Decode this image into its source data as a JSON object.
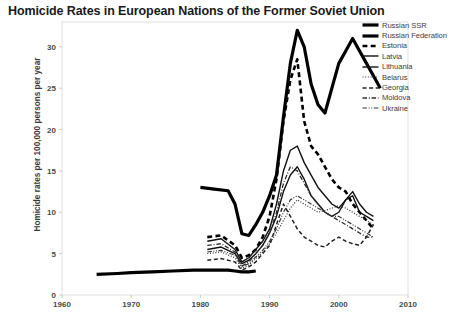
{
  "chart_data": {
    "type": "line",
    "title": "Homicide Rates in European Nations of the Former Soviet Union",
    "xlabel": "",
    "ylabel": "Homicide rates per 100,000 persons per year",
    "xlim": [
      1960,
      2010
    ],
    "ylim": [
      0,
      33
    ],
    "xticks": [
      1960,
      1970,
      1980,
      1990,
      2000,
      2010
    ],
    "yticks": [
      0,
      5,
      10,
      15,
      20,
      25,
      30
    ],
    "grid": false,
    "legend_position": "top-right",
    "series": [
      {
        "name": "Russian SSR",
        "style": "solid",
        "width": 3.2,
        "color": "#000000",
        "x": [
          1965,
          1968,
          1970,
          1973,
          1976,
          1979,
          1980,
          1982,
          1984,
          1985,
          1986,
          1987,
          1988
        ],
        "y": [
          2.5,
          2.6,
          2.7,
          2.8,
          2.9,
          3.0,
          3.0,
          3.0,
          3.0,
          2.9,
          2.8,
          2.8,
          2.9
        ]
      },
      {
        "name": "Russian Federation",
        "style": "solid",
        "width": 3.2,
        "color": "#000000",
        "x": [
          1980,
          1982,
          1984,
          1985,
          1986,
          1987,
          1988,
          1989,
          1990,
          1991,
          1992,
          1993,
          1994,
          1995,
          1996,
          1997,
          1998,
          1999,
          2000,
          2001,
          2002,
          2003,
          2004,
          2005,
          2006
        ],
        "y": [
          13.0,
          12.8,
          12.6,
          11.0,
          7.4,
          7.2,
          8.5,
          10.0,
          12.0,
          14.5,
          21.5,
          28.0,
          32.0,
          30.0,
          25.5,
          23.0,
          22.0,
          25.0,
          28.0,
          29.5,
          31.0,
          29.5,
          28.0,
          26.5,
          25.0
        ]
      },
      {
        "name": "Estonia",
        "style": "bold-dashed",
        "width": 2.6,
        "color": "#000000",
        "x": [
          1981,
          1983,
          1985,
          1986,
          1987,
          1988,
          1989,
          1990,
          1991,
          1992,
          1993,
          1994,
          1995,
          1996,
          1997,
          1998,
          1999,
          2000,
          2001,
          2002,
          2003,
          2004,
          2005
        ],
        "y": [
          7.0,
          7.2,
          6.0,
          4.5,
          4.8,
          5.5,
          7.0,
          9.5,
          14.0,
          21.0,
          26.0,
          28.5,
          21.0,
          18.0,
          17.0,
          15.5,
          14.0,
          13.0,
          12.5,
          11.0,
          10.0,
          9.0,
          8.0
        ]
      },
      {
        "name": "Latvia",
        "style": "solid",
        "width": 1.4,
        "color": "#111111",
        "x": [
          1981,
          1983,
          1985,
          1986,
          1987,
          1988,
          1989,
          1990,
          1991,
          1992,
          1993,
          1994,
          1995,
          1996,
          1997,
          1998,
          1999,
          2000,
          2001,
          2002,
          2003,
          2004,
          2005
        ],
        "y": [
          6.5,
          6.8,
          5.5,
          4.0,
          4.5,
          5.5,
          6.5,
          8.0,
          11.0,
          15.0,
          17.5,
          18.0,
          16.0,
          14.5,
          13.0,
          12.0,
          11.0,
          10.5,
          11.5,
          12.0,
          10.0,
          9.5,
          9.0
        ]
      },
      {
        "name": "Lithuania",
        "style": "solid",
        "width": 1.4,
        "color": "#111111",
        "x": [
          1981,
          1983,
          1985,
          1986,
          1987,
          1988,
          1989,
          1990,
          1991,
          1992,
          1993,
          1994,
          1995,
          1996,
          1997,
          1998,
          1999,
          2000,
          2001,
          2002,
          2003,
          2004,
          2005
        ],
        "y": [
          5.5,
          5.8,
          5.0,
          3.8,
          4.2,
          5.0,
          6.0,
          7.5,
          9.5,
          12.5,
          14.5,
          15.5,
          14.0,
          12.0,
          11.0,
          10.0,
          9.5,
          10.0,
          11.5,
          12.5,
          11.0,
          10.0,
          9.5
        ]
      },
      {
        "name": "Belarus",
        "style": "dotted",
        "width": 1.2,
        "color": "#333333",
        "x": [
          1981,
          1983,
          1985,
          1986,
          1987,
          1988,
          1989,
          1990,
          1991,
          1992,
          1993,
          1994,
          1995,
          1996,
          1997,
          1998,
          1999,
          2000,
          2001,
          2002,
          2003,
          2004,
          2005
        ],
        "y": [
          5.0,
          5.2,
          4.5,
          3.2,
          3.6,
          4.4,
          5.2,
          6.2,
          7.5,
          9.0,
          10.5,
          11.5,
          11.0,
          10.5,
          10.0,
          10.2,
          10.5,
          10.8,
          10.5,
          10.0,
          9.5,
          9.0,
          8.5
        ]
      },
      {
        "name": "Georgia",
        "style": "dashed",
        "width": 1.5,
        "color": "#222222",
        "x": [
          1981,
          1983,
          1985,
          1986,
          1987,
          1988,
          1989,
          1990,
          1991,
          1992,
          1993,
          1994,
          1995,
          1996,
          1997,
          1998,
          1999,
          2000,
          2001,
          2002,
          2003,
          2004,
          2005
        ],
        "y": [
          4.2,
          4.4,
          4.0,
          3.0,
          3.4,
          4.0,
          5.0,
          6.0,
          8.5,
          11.0,
          9.5,
          8.0,
          7.0,
          6.5,
          6.0,
          5.8,
          6.5,
          7.0,
          6.5,
          6.2,
          6.0,
          7.0,
          8.5
        ]
      },
      {
        "name": "Moldova",
        "style": "dash-dot",
        "width": 1.3,
        "color": "#2b2b2b",
        "x": [
          1981,
          1983,
          1985,
          1986,
          1987,
          1988,
          1989,
          1990,
          1991,
          1992,
          1993,
          1994,
          1995,
          1996,
          1997,
          1998,
          1999,
          2000,
          2001,
          2002,
          2003,
          2004,
          2005
        ],
        "y": [
          6.0,
          6.2,
          5.2,
          3.5,
          4.0,
          5.0,
          6.0,
          7.5,
          10.0,
          13.5,
          15.5,
          15.0,
          13.5,
          12.0,
          11.0,
          10.0,
          9.5,
          9.0,
          8.5,
          8.0,
          7.5,
          7.0,
          7.0
        ]
      },
      {
        "name": "Ukraine",
        "style": "dash-dot-dot",
        "width": 1.2,
        "color": "#3a3a3a",
        "x": [
          1981,
          1983,
          1985,
          1986,
          1987,
          1988,
          1989,
          1990,
          1991,
          1992,
          1993,
          1994,
          1995,
          1996,
          1997,
          1998,
          1999,
          2000,
          2001,
          2002,
          2003,
          2004,
          2005
        ],
        "y": [
          5.2,
          5.4,
          4.8,
          3.4,
          3.8,
          4.6,
          5.4,
          6.5,
          8.0,
          10.0,
          11.5,
          12.0,
          11.5,
          11.0,
          10.5,
          10.0,
          9.5,
          9.5,
          9.0,
          8.5,
          8.0,
          7.5,
          7.0
        ]
      }
    ]
  }
}
